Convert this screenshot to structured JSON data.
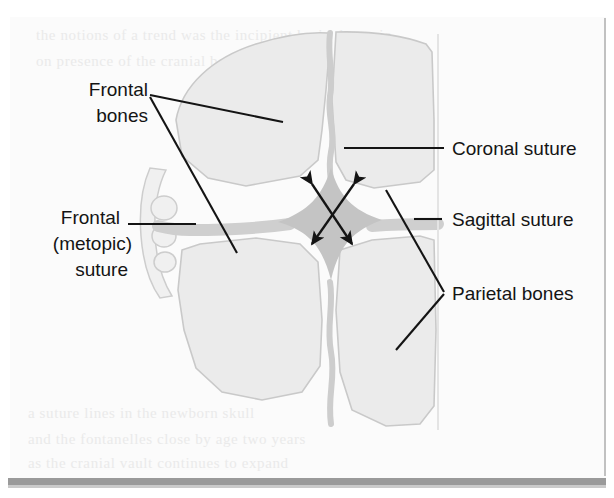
{
  "figure": {
    "kind": "anatomical-illustration",
    "background_color": "#ffffff",
    "plate_color": "#fbfbfb",
    "ink_color": "#141414"
  },
  "colors": {
    "bone_fill": "#ebebeb",
    "bone_outline": "#c9c9c9",
    "suture_band": "#cfcfcf",
    "fontanelle": "#c4c4c4",
    "ghost": "#e9e9e9",
    "gutter_line": "#b3b3b3",
    "bottom_bar": "#9a9a9a",
    "ink": "#141414"
  },
  "labels": [
    {
      "id": "frontal-bones",
      "lines": [
        "Frontal",
        "bones"
      ],
      "anchor": "end",
      "x": 148,
      "y": [
        96,
        122
      ],
      "leader": "v-branch"
    },
    {
      "id": "frontal-metopic-suture",
      "lines": [
        "Frontal",
        "(metopic)",
        "suture"
      ],
      "anchor": "end",
      "x": 120,
      "y": [
        224,
        250,
        276
      ],
      "leader": "horizontal-dash"
    },
    {
      "id": "coronal-suture",
      "lines": [
        "Coronal suture"
      ],
      "anchor": "start",
      "x": 452,
      "y": [
        155
      ],
      "leader": "horizontal-long"
    },
    {
      "id": "sagittal-suture",
      "lines": [
        "Sagittal suture"
      ],
      "anchor": "start",
      "x": 452,
      "y": [
        224
      ],
      "leader": "short-dash"
    },
    {
      "id": "parietal-bones",
      "lines": [
        "Parietal bones"
      ],
      "anchor": "start",
      "x": 452,
      "y": [
        298
      ],
      "leader": "chevron-branch"
    }
  ],
  "bones": [
    {
      "id": "left-frontal-bone",
      "name": "Frontal bone (left)"
    },
    {
      "id": "right-frontal-bone",
      "name": "Frontal bone (right)"
    },
    {
      "id": "left-parietal-bone",
      "name": "Parietal bone (left)"
    },
    {
      "id": "right-parietal-bone",
      "name": "Parietal bone (right)"
    }
  ],
  "sutures": [
    {
      "id": "coronal-suture-band",
      "name": "Coronal suture"
    },
    {
      "id": "sagittal-suture-band",
      "name": "Sagittal suture"
    },
    {
      "id": "metopic-suture-band",
      "name": "Frontal (metopic) suture"
    }
  ],
  "fontanelle": {
    "id": "anterior-fontanelle",
    "name": "Anterior fontanelle",
    "arrow_count": 2,
    "arrow_style": "double-headed",
    "arrangement": "crossed-x"
  },
  "ghost_text": {
    "top": [
      "the notions of a trend  was  the incipient brain  dynamic",
      "on  presence  of  the  cranial  bones"
    ],
    "bottom": [
      "a  suture  lines  in  the  newborn  skull",
      "and  the  fontanelles  close  by  age  two  years",
      "as  the  cranial  vault  continues  to  expand"
    ]
  }
}
